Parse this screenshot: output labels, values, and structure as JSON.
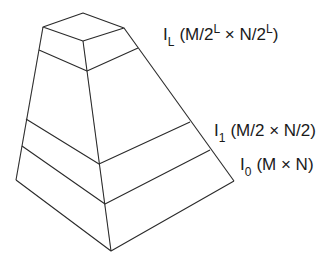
{
  "diagram": {
    "type": "image-pyramid",
    "levels": [
      {
        "name": "I",
        "sub": "L",
        "size_prefix": "(M/2",
        "sup1": "L",
        "mid": " × N/2",
        "sup2": "L",
        "size_suffix": ")"
      },
      {
        "name": "I",
        "sub": "1",
        "size": "(M/2 × N/2)"
      },
      {
        "name": "I",
        "sub": "0",
        "size": "(M × N)"
      }
    ]
  }
}
